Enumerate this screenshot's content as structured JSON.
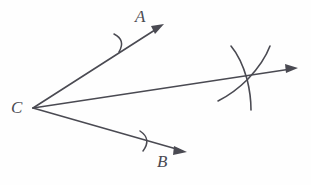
{
  "figure": {
    "width": 311,
    "height": 185,
    "background_color": "#fefefe",
    "stroke_color": "#4a4a52",
    "stroke_width": 1.5
  },
  "labels": {
    "point_a": "A",
    "point_b": "B",
    "vertex_c": "C"
  },
  "geometry": {
    "vertex": {
      "name": "C",
      "x": 33,
      "y": 108
    },
    "rays": [
      {
        "name": "ray-CA",
        "label": "A",
        "from": {
          "x": 33,
          "y": 108
        },
        "to": {
          "x": 163,
          "y": 25
        },
        "has_arrowhead": true,
        "tick_mark": {
          "x": 122,
          "y": 42
        }
      },
      {
        "name": "ray-bisector",
        "label": "",
        "from": {
          "x": 33,
          "y": 108
        },
        "to": {
          "x": 297,
          "y": 68
        },
        "has_arrowhead": true,
        "tick_mark": null
      },
      {
        "name": "ray-CB",
        "label": "B",
        "from": {
          "x": 33,
          "y": 108
        },
        "to": {
          "x": 186,
          "y": 152
        },
        "has_arrowhead": true,
        "tick_mark": {
          "x": 146,
          "y": 141
        }
      }
    ],
    "construction_arcs": [
      {
        "name": "arc-from-a-side",
        "start": {
          "x": 231,
          "y": 46
        },
        "end": {
          "x": 251,
          "y": 108
        },
        "bulge_direction": "left"
      },
      {
        "name": "arc-from-b-side",
        "start": {
          "x": 270,
          "y": 46
        },
        "end": {
          "x": 219,
          "y": 101
        },
        "bulge_direction": "right"
      }
    ],
    "arc_intersection": {
      "x": 248,
      "y": 79
    }
  }
}
